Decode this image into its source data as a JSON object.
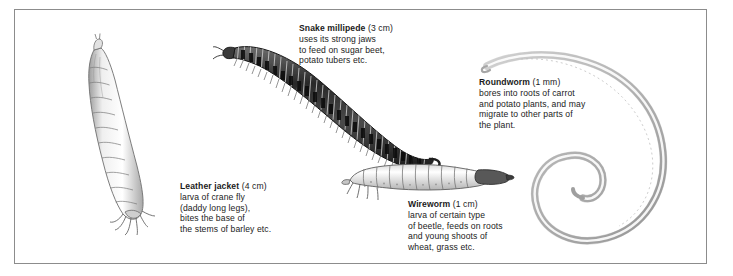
{
  "figure": {
    "border_color": "#8c8c8c",
    "background": "#ffffff"
  },
  "organisms": [
    {
      "id": "snake-millipede",
      "name": "Snake millipede",
      "size": "(3 cm)",
      "lines": [
        "uses its strong jaws",
        "to feed on sugar beet,",
        "potato tubers etc."
      ],
      "art_color": "#3a3a3a"
    },
    {
      "id": "roundworm",
      "name": "Roundworm",
      "size": "(1 mm)",
      "lines": [
        "bores into roots of carrot",
        "and potato plants, and may",
        "migrate to other parts of",
        "the plant."
      ],
      "art_color": "#b9b9b9"
    },
    {
      "id": "leather-jacket",
      "name": "Leather jacket",
      "size": "(4 cm)",
      "lines": [
        "larva of crane fly",
        "(daddy long legs),",
        "bites the base of",
        "the stems of barley etc."
      ],
      "art_color": "#c9c9c9"
    },
    {
      "id": "wireworm",
      "name": "Wireworm",
      "size": "(1 cm)",
      "lines": [
        "larva of certain type",
        "of beetle, feeds on roots",
        "and young shoots of",
        "wheat, grass etc."
      ],
      "art_color": "#d0d0d0"
    }
  ]
}
